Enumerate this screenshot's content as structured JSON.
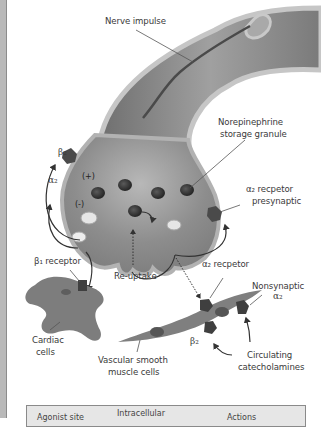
{
  "diagram": {
    "labels": {
      "nerve_impulse": "Nerve impulse",
      "storage_granule_l1": "Norepinephrine",
      "storage_granule_l2": "storage granule",
      "beta2_top": "β₂",
      "alpha2_left": "α₂",
      "plus_sign": "(+)",
      "minus_sign": "(-)",
      "alpha2_presyn_l1": "α₂ recpetor",
      "alpha2_presyn_l2": "presynaptic",
      "beta1_receptor": "β₁ receptor",
      "reuptake": "Re-uptake",
      "alpha2_receptor": "α₂ recpetor",
      "nonsynaptic_l1": "Nonsynaptic",
      "nonsynaptic_l2": "α₂",
      "beta2_bottom": "β₂",
      "cardiac_l1": "Cardiac",
      "cardiac_l2": "cells",
      "vascular_l1": "Vascular smooth",
      "vascular_l2": "muscle cells",
      "circulating_l1": "Circulating",
      "circulating_l2": "catecholamines"
    },
    "colors": {
      "neuron_fill": "#8f8f8f",
      "neuron_edge": "#b4b4b4",
      "granule": "#3a3a3a",
      "receptor": "#4a4a4a",
      "text": "#3a3a3a"
    }
  },
  "table": {
    "headers": [
      "Agonist site",
      "Intracellular",
      "Actions"
    ]
  }
}
